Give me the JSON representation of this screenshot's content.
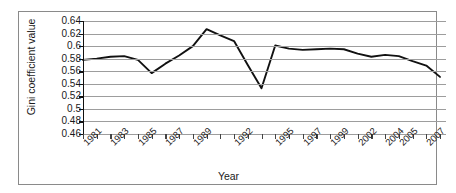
{
  "chart_data": {
    "type": "line",
    "title": "",
    "xlabel": "Year",
    "ylabel": "Gini coefficient value",
    "ylim": [
      0.46,
      0.64
    ],
    "ytick_labels": [
      "0.64",
      "0.62",
      "0.6",
      "0.58",
      "0.56",
      "0.54",
      "0.52",
      "0.5",
      "0.48",
      "0.46"
    ],
    "ytick_values": [
      0.64,
      0.62,
      0.6,
      0.58,
      0.56,
      0.54,
      0.52,
      0.5,
      0.48,
      0.46
    ],
    "grid": true,
    "legend": "none",
    "xtick_labels": [
      "1981",
      "1983",
      "1985",
      "1987",
      "1989",
      "1992",
      "1995",
      "1997",
      "1999",
      "2002",
      "2004",
      "2005",
      "2007"
    ],
    "categories": [
      "1981",
      "1982",
      "1983",
      "1984",
      "1985",
      "1986",
      "1987",
      "1988",
      "1989",
      "1990",
      "1991",
      "1992",
      "1993",
      "1994",
      "1995",
      "1996",
      "1997",
      "1998",
      "1999",
      "2000",
      "2002",
      "2003",
      "2004",
      "2005",
      "2006",
      "2007",
      "2008"
    ],
    "series": [
      {
        "name": "Gini coefficient",
        "values": [
          0.578,
          0.58,
          0.583,
          0.584,
          0.578,
          0.557,
          0.572,
          0.585,
          0.6,
          0.627,
          0.617,
          0.608,
          0.57,
          0.533,
          0.601,
          0.596,
          0.594,
          0.595,
          0.596,
          0.595,
          0.588,
          0.583,
          0.586,
          0.584,
          0.576,
          0.569,
          0.551
        ]
      }
    ],
    "line_color": "#111111",
    "grid_color": "#9d9d9d",
    "axis_color": "#111111"
  }
}
